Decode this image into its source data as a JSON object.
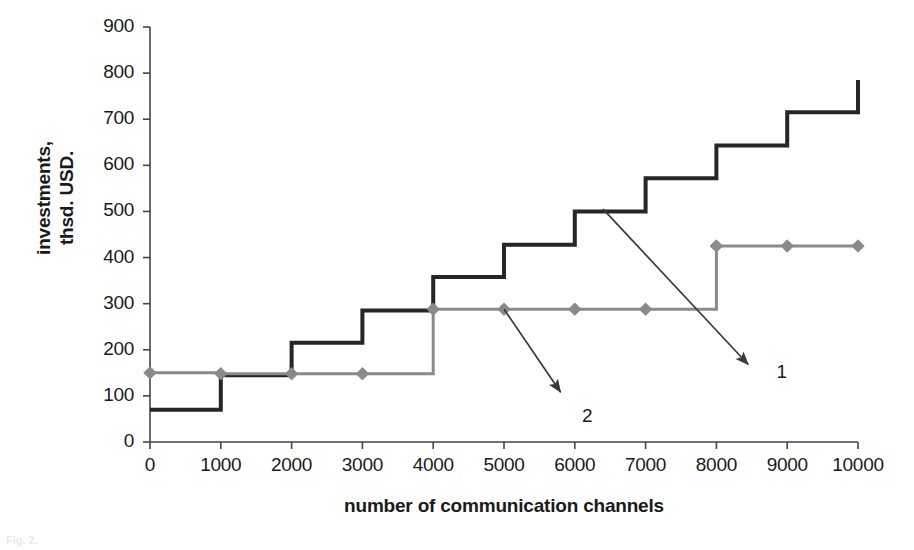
{
  "chart_data": {
    "type": "line",
    "subtype": "step",
    "title": "",
    "xlabel": "number of communication channels",
    "ylabel": "investments, thsd. USD.",
    "ylabel_lines": [
      "investments,",
      "thsd. USD."
    ],
    "x": [
      0,
      1000,
      2000,
      3000,
      4000,
      5000,
      6000,
      7000,
      8000,
      9000,
      10000
    ],
    "xlim": [
      0,
      10000
    ],
    "ylim": [
      0,
      900
    ],
    "xticks": [
      0,
      1000,
      2000,
      3000,
      4000,
      5000,
      6000,
      7000,
      8000,
      9000,
      10000
    ],
    "xtick_labels": [
      "0",
      "1000",
      "2000",
      "3000",
      "4000",
      "5000",
      "6000",
      "7000",
      "8000",
      "9000",
      "10000"
    ],
    "yticks": [
      0,
      100,
      200,
      300,
      400,
      500,
      600,
      700,
      800,
      900
    ],
    "ytick_labels": [
      "0",
      "100",
      "200",
      "300",
      "400",
      "500",
      "600",
      "700",
      "800",
      "900"
    ],
    "grid": false,
    "legend": "none",
    "series": [
      {
        "name": "1",
        "label": "1",
        "color": "#262626",
        "style": "step-post",
        "linewidth": 4,
        "markers": false,
        "step_values": [
          70,
          145,
          215,
          285,
          358,
          428,
          500,
          572,
          643,
          715
        ],
        "end_value": 785,
        "description": "black step line, rises one step per 1000 channels"
      },
      {
        "name": "2",
        "label": "2",
        "color": "#8a8a8a",
        "style": "step-post",
        "linewidth": 3,
        "markers": true,
        "marker": "diamond",
        "values": [
          150,
          148,
          148,
          148,
          288,
          288,
          288,
          288,
          425,
          425,
          425
        ],
        "description": "grey step line with diamond markers, two jumps at 4000 and 8000"
      }
    ],
    "annotations": [
      {
        "text": "1",
        "points_to_series": "1",
        "arrow_from": [
          6400,
          505
        ],
        "arrow_to": [
          8450,
          168
        ],
        "label_at": [
          8850,
          150
        ]
      },
      {
        "text": "2",
        "points_to_series": "2",
        "arrow_from": [
          5000,
          288
        ],
        "arrow_to": [
          5800,
          108
        ],
        "label_at": [
          6100,
          55
        ]
      }
    ]
  },
  "caption": {
    "text": "Fig. 2."
  }
}
